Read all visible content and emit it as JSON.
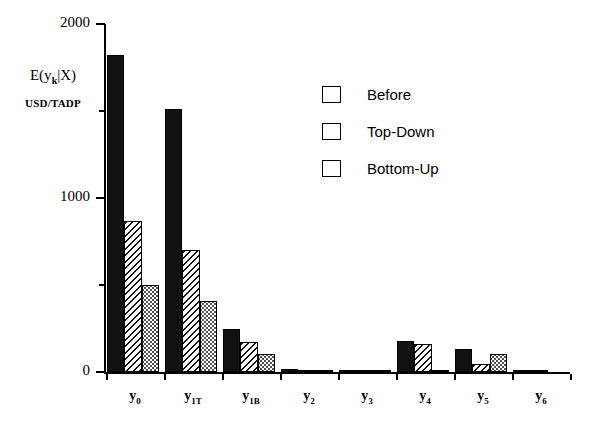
{
  "chart_data": {
    "type": "bar",
    "title": "",
    "xlabel": "",
    "ylabel": "E(y_k|X)",
    "ylabel_main": "E(y",
    "ylabel_sub": "k",
    "ylabel_tail": "|X)",
    "yunits": "USD/TADP",
    "ylim": [
      0,
      2000
    ],
    "grid": false,
    "legend_position": "top-right",
    "categories": [
      "y0",
      "y1T",
      "y1B",
      "y2",
      "y3",
      "y4",
      "y5",
      "y6"
    ],
    "category_labels": [
      {
        "base": "y",
        "sub": "0"
      },
      {
        "base": "y",
        "sub": "1T"
      },
      {
        "base": "y",
        "sub": "1B"
      },
      {
        "base": "y",
        "sub": "2"
      },
      {
        "base": "y",
        "sub": "3"
      },
      {
        "base": "y",
        "sub": "4"
      },
      {
        "base": "y",
        "sub": "5"
      },
      {
        "base": "y",
        "sub": "6"
      }
    ],
    "ytick_labels": [
      "0",
      "1000",
      "2000"
    ],
    "ytick_values": [
      0,
      1000,
      2000
    ],
    "yminor_values": [
      500,
      1500
    ],
    "series": [
      {
        "name": "Before",
        "pattern": "solid-black",
        "values": [
          1820,
          1510,
          250,
          15,
          10,
          180,
          130,
          12
        ]
      },
      {
        "name": "Top-Down",
        "pattern": "diagonal-hatch",
        "values": [
          870,
          700,
          170,
          8,
          8,
          160,
          45,
          5
        ]
      },
      {
        "name": "Bottom-Up",
        "pattern": "dotted-light",
        "values": [
          500,
          410,
          105,
          5,
          5,
          12,
          105,
          0
        ]
      }
    ]
  },
  "legend": {
    "items": [
      {
        "label": "Before"
      },
      {
        "label": "Top-Down"
      },
      {
        "label": "Bottom-Up"
      }
    ]
  },
  "colors": {
    "axis": "#000000",
    "series_before": "#111111",
    "series_topdown_line": "#111111",
    "series_bottomup_dot": "#444444",
    "background": "#ffffff"
  }
}
